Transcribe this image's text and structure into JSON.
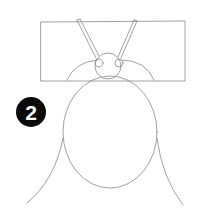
{
  "illustration": {
    "type": "drawing-tutorial-step",
    "subject": "insect sketch",
    "step": {
      "number": "2",
      "badge_color": "#0a0a0a",
      "text_color": "#ffffff"
    },
    "stroke_color": "#8a8a8a",
    "background": "#ffffff"
  }
}
